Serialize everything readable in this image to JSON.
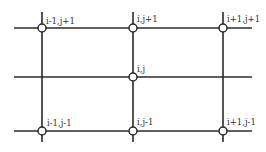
{
  "diagram": {
    "type": "finite-difference-grid-stencil",
    "colors": {
      "line": "#2a2a2a",
      "node_fill": "#ffffff",
      "text": "#333333"
    },
    "vertical_lines_x": [
      42,
      133,
      223
    ],
    "horizontal_lines_y": [
      28,
      77,
      131
    ],
    "nodes": [
      {
        "id": "n_im1_jp1",
        "label": "i-1,j+1",
        "x": 42,
        "y": 28
      },
      {
        "id": "n_i_jp1",
        "label": "i,j+1",
        "x": 133,
        "y": 28
      },
      {
        "id": "n_ip1_jp1",
        "label": "i+1,j+1",
        "x": 223,
        "y": 28
      },
      {
        "id": "n_i_j",
        "label": "i,j",
        "x": 133,
        "y": 77
      },
      {
        "id": "n_im1_jm1",
        "label": "i-1,j-1",
        "x": 42,
        "y": 131
      },
      {
        "id": "n_i_jm1",
        "label": "i,j-1",
        "x": 133,
        "y": 131
      },
      {
        "id": "n_ip1_jm1",
        "label": "i+1,j-1",
        "x": 223,
        "y": 131
      }
    ]
  }
}
